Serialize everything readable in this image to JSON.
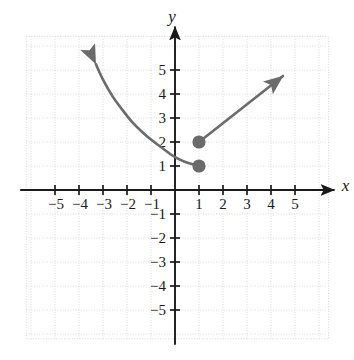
{
  "figure": {
    "kind": "cartesian-graph",
    "background_color": "#ffffff",
    "axis_color": "#1a1a1a",
    "grid_color": "#d8d8d8",
    "curve_color": "#6b6b6b",
    "point_color": "#6b6b6b",
    "x_axis_label": "x",
    "y_axis_label": "y"
  },
  "axes": {
    "x_min": -6.2,
    "x_max": 6.4,
    "y_min": -6.2,
    "y_max": 6.4,
    "unit_px": 24,
    "origin_px": {
      "x": 175,
      "y": 190
    },
    "grid": "on",
    "grid_step": 1,
    "x_tick_labels": [
      "-5",
      "-4",
      "-3",
      "-2",
      "-1",
      "1",
      "2",
      "3",
      "4",
      "5"
    ],
    "x_tick_values": [
      -5,
      -4,
      -3,
      -2,
      -1,
      1,
      2,
      3,
      4,
      5
    ],
    "y_tick_labels": [
      "5",
      "4",
      "3",
      "2",
      "1",
      "-1",
      "-2",
      "-3",
      "-4",
      "-5"
    ],
    "y_tick_values": [
      5,
      4,
      3,
      2,
      1,
      -1,
      -2,
      -3,
      -4,
      -5
    ]
  },
  "chart_data": {
    "type": "line",
    "title": "",
    "xlabel": "x",
    "ylabel": "y",
    "xlim": [
      -6.2,
      6.4
    ],
    "ylim": [
      -6.2,
      6.4
    ],
    "grid": true,
    "legend": "none",
    "series": [
      {
        "name": "left-branch-curve",
        "style": "curve",
        "arrow": "start",
        "arrow_tip": {
          "x": -3.3,
          "y": 5.25
        },
        "endpoint": {
          "x": 1,
          "y": 1,
          "marker": "filled"
        },
        "points": [
          {
            "x": -3.3,
            "y": 5.25
          },
          {
            "x": -3.0,
            "y": 4.6
          },
          {
            "x": -2.6,
            "y": 3.9
          },
          {
            "x": -2.2,
            "y": 3.35
          },
          {
            "x": -1.8,
            "y": 2.85
          },
          {
            "x": -1.4,
            "y": 2.45
          },
          {
            "x": -1.0,
            "y": 2.1
          },
          {
            "x": -0.6,
            "y": 1.8
          },
          {
            "x": -0.2,
            "y": 1.5
          },
          {
            "x": 0.1,
            "y": 1.32
          },
          {
            "x": 0.4,
            "y": 1.18
          },
          {
            "x": 0.7,
            "y": 1.08
          },
          {
            "x": 1.0,
            "y": 1.0
          }
        ]
      },
      {
        "name": "right-branch-ray",
        "style": "straight",
        "arrow": "end",
        "arrow_tip": {
          "x": 4.5,
          "y": 4.75
        },
        "endpoint": {
          "x": 1,
          "y": 2,
          "marker": "filled"
        },
        "points": [
          {
            "x": 1.0,
            "y": 2.0
          },
          {
            "x": 4.5,
            "y": 4.75
          }
        ]
      }
    ],
    "points": [
      {
        "x": 1,
        "y": 2,
        "marker": "filled",
        "label": ""
      },
      {
        "x": 1,
        "y": 1,
        "marker": "filled",
        "label": ""
      }
    ]
  }
}
